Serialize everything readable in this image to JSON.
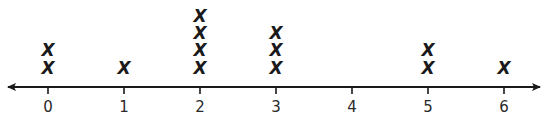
{
  "chart_data": {
    "type": "dot_plot",
    "title": "",
    "xlabel": "",
    "ylabel": "",
    "marker": "X",
    "categories": [
      "0",
      "1",
      "2",
      "3",
      "4",
      "5",
      "6"
    ],
    "x": [
      0,
      1,
      2,
      3,
      4,
      5,
      6
    ],
    "values": [
      2,
      1,
      4,
      3,
      0,
      2,
      1
    ],
    "xlim": [
      0,
      6
    ],
    "axis_arrows": "both",
    "grid": false,
    "legend": null
  },
  "colors": {
    "axis": "#1a1a1a",
    "marker": "#1a1a1a",
    "background": "#ffffff"
  }
}
